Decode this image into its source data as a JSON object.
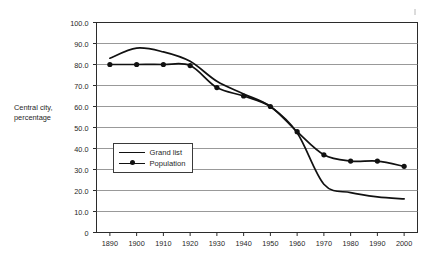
{
  "chart_data": {
    "type": "line",
    "title": "",
    "xlabel": "",
    "ylabel": "Central city, percentage",
    "x": [
      1890,
      1900,
      1910,
      1920,
      1930,
      1940,
      1950,
      1960,
      1970,
      1980,
      1990,
      2000
    ],
    "xlim": [
      1885,
      2005
    ],
    "ylim": [
      0,
      100
    ],
    "grid": true,
    "legend_position": "inside lower-left",
    "y_ticks": [
      "0",
      "10.0",
      "20.0",
      "30.0",
      "40.0",
      "50.0",
      "60.0",
      "70.0",
      "80.0",
      "90.0",
      "100.0"
    ],
    "y_tick_values": [
      0,
      10,
      20,
      30,
      40,
      50,
      60,
      70,
      80,
      90,
      100
    ],
    "x_ticks": [
      "1890",
      "1900",
      "1910",
      "1920",
      "1930",
      "1940",
      "1950",
      "1960",
      "1970",
      "1980",
      "1990",
      "2000"
    ],
    "series": [
      {
        "name": "Grand list",
        "marker": "none",
        "color": "#111111",
        "values": [
          83.0,
          87.8,
          86.0,
          81.5,
          72.0,
          66.0,
          60.0,
          47.5,
          23.0,
          19.0,
          17.0,
          16.0
        ]
      },
      {
        "name": "Population",
        "marker": "circle",
        "color": "#111111",
        "values": [
          80.0,
          80.0,
          80.0,
          79.5,
          69.0,
          65.0,
          60.0,
          48.0,
          37.0,
          34.0,
          34.0,
          31.5
        ]
      }
    ]
  },
  "legend": {
    "entries": [
      {
        "label": "Grand list"
      },
      {
        "label": "Population"
      }
    ]
  },
  "axis": {
    "y_title_line1": "Central city,",
    "y_title_line2": "percentage"
  }
}
